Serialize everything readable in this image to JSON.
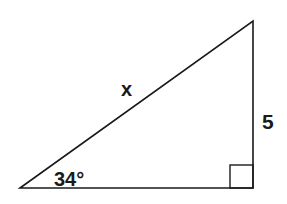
{
  "diagram": {
    "type": "right-triangle",
    "labels": {
      "hypotenuse": "x",
      "opposite_side": "5",
      "angle": "34°"
    },
    "right_angle_marker": true,
    "colors": {
      "stroke": "#1a1a1a",
      "background": "#ffffff"
    }
  }
}
